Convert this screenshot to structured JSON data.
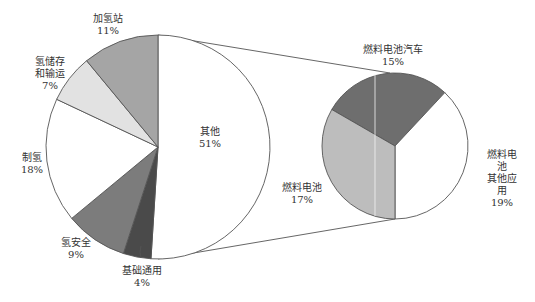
{
  "chart_data": {
    "type": "pie",
    "subtype": "pie-of-pie",
    "title": "",
    "main_pie": {
      "center": [
        158,
        147
      ],
      "radius": 112,
      "start_angle_deg": 0,
      "slices": [
        {
          "label": "其他",
          "value": 51,
          "pct_label": "51%",
          "color": "#ffffff",
          "label_pos": [
            210,
            126
          ]
        },
        {
          "label": "基础通用",
          "value": 4,
          "pct_label": "4%",
          "color": "#4a4a4a",
          "label_pos": [
            142,
            265
          ]
        },
        {
          "label": "氢安全",
          "value": 9,
          "pct_label": "9%",
          "color": "#7c7c7c",
          "label_pos": [
            76,
            237
          ]
        },
        {
          "label": "制氢",
          "value": 18,
          "pct_label": "18%",
          "color": "#ffffff",
          "label_pos": [
            32,
            152
          ]
        },
        {
          "label": "氢储存\n和输运",
          "value": 7,
          "pct_label": "7%",
          "color": "#e2e2e2",
          "label_pos": [
            50,
            56
          ]
        },
        {
          "label": "加氢站",
          "value": 11,
          "pct_label": "11%",
          "color": "#a5a5a5",
          "label_pos": [
            108,
            13
          ]
        }
      ]
    },
    "secondary_pie": {
      "parent_slice": "其他",
      "center": [
        395,
        146
      ],
      "radius": 73,
      "slices": [
        {
          "label": "燃料电池汽车",
          "value": 15,
          "pct_label": "15%",
          "color": "#6e6e6e",
          "start_deg": 300,
          "end_deg": 403,
          "label_pos": [
            393,
            44
          ]
        },
        {
          "label": "燃料电池\n其他应用",
          "value": 19,
          "pct_label": "19%",
          "color": "#ffffff",
          "start_deg": 43,
          "end_deg": 180,
          "label_pos": [
            502,
            149
          ]
        },
        {
          "label": "燃料电池",
          "value": 17,
          "pct_label": "17%",
          "color": "#bdbdbd",
          "start_deg": 180,
          "end_deg": 300,
          "label_pos": [
            302,
            182
          ]
        }
      ]
    },
    "connector_lines": [
      {
        "from": [
          158,
          35
        ],
        "to": [
          390,
          73
        ]
      },
      {
        "from": [
          158,
          259
        ],
        "to": [
          395,
          219
        ]
      }
    ],
    "stroke_color": "#555555",
    "legend": "none",
    "units": "%"
  }
}
